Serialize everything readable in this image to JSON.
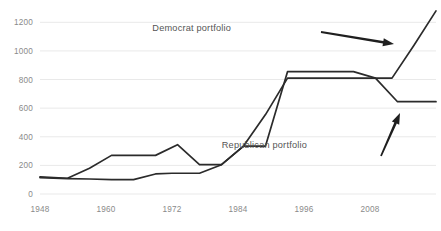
{
  "chart_data": {
    "type": "line",
    "title": "",
    "subtitle": "",
    "xlabel": "",
    "ylabel": "",
    "xlim": [
      1948,
      2020
    ],
    "ylim": [
      0,
      1300
    ],
    "grid": true,
    "grid_orientation": "horizontal",
    "legend": "none",
    "legend_position": "inline-annotations",
    "y_ticks": [
      0,
      200,
      400,
      600,
      800,
      1000,
      1200
    ],
    "y_tick_labels": [
      "0",
      "200",
      "400",
      "600",
      "800",
      "1000",
      "1200"
    ],
    "x_ticks": [
      1948,
      1960,
      1972,
      1984,
      1996,
      2008
    ],
    "x_tick_labels": [
      "1948",
      "1960",
      "1972",
      "1984",
      "1996",
      "2008"
    ],
    "series": [
      {
        "name": "Democrat portfolio",
        "color": "#2b2b2b",
        "x": [
          1948,
          1953,
          1957,
          1961,
          1965,
          1969,
          1973,
          1977,
          1979,
          1981,
          1985,
          1989,
          1993,
          1997,
          2001,
          2005,
          2009,
          2013,
          2017,
          2020
        ],
        "values": [
          120,
          110,
          180,
          270,
          270,
          270,
          345,
          205,
          205,
          205,
          335,
          335,
          855,
          855,
          855,
          855,
          810,
          645,
          645,
          645
        ]
      },
      {
        "name": "Republican portfolio",
        "color": "#2b2b2b",
        "x": [
          1948,
          1953,
          1957,
          1961,
          1965,
          1969,
          1972,
          1977,
          1981,
          1985,
          1989,
          1993,
          1997,
          2001,
          2005,
          2009,
          2012,
          2016,
          2020
        ],
        "values": [
          115,
          108,
          105,
          100,
          100,
          140,
          145,
          145,
          205,
          335,
          555,
          810,
          810,
          810,
          810,
          810,
          810,
          1040,
          1280
        ]
      }
    ],
    "annotations": [
      {
        "id": "democrat-annotation",
        "text": "Democrat portfolio",
        "label_x": 231,
        "label_y": 31,
        "arrow_from_x": 321,
        "arrow_from_y": 32,
        "arrow_to_x": 394,
        "arrow_to_y": 44,
        "points_to_series": "Democrat portfolio"
      },
      {
        "id": "republican-annotation",
        "text": "Republican portfolio",
        "label_x": 307,
        "label_y": 148,
        "arrow_from_x": 381,
        "arrow_from_y": 156,
        "arrow_to_x": 400,
        "arrow_to_y": 113,
        "points_to_series": "Republican portfolio"
      }
    ],
    "colors": {
      "background": "#ffffff",
      "gridline": "#e9e9e9",
      "line": "#2b2b2b",
      "tick_text": "#8a8a8a",
      "annotation_text": "#555555",
      "arrow": "#1f1f1f"
    },
    "geometry": {
      "plot_left": 40,
      "plot_right": 436,
      "plot_top": 8,
      "plot_bottom": 194,
      "y_value_top": 1300,
      "y_value_bottom": 0,
      "x_value_left": 1948,
      "x_value_right": 2020
    }
  }
}
